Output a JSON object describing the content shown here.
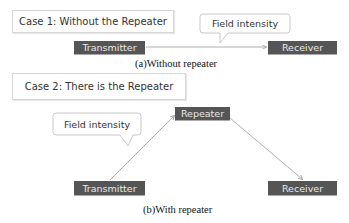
{
  "case1": {
    "title": "Case 1: Without the Repeater",
    "callout": "Field intensity",
    "transmitter": "Transmitter",
    "receiver": "Receiver",
    "caption": "(a)Without repeater"
  },
  "case2": {
    "title": "Case 2: There is the Repeater",
    "callout": "Field intensity",
    "repeater": "Repeater",
    "transmitter": "Transmitter",
    "receiver": "Receiver",
    "caption": "(b)With repeater"
  },
  "colors": {
    "node_fill": "#555555",
    "node_text": "#e8e8e8",
    "arrow": "#9a9a9a",
    "box_border": "#d6d6d6"
  }
}
